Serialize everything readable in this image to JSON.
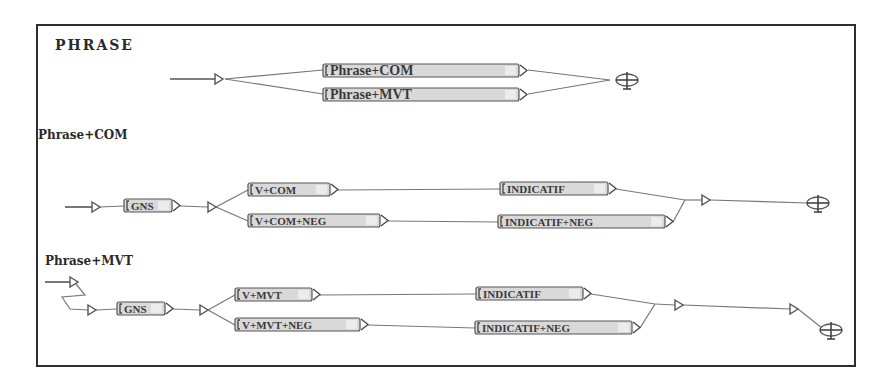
{
  "colors": {
    "frame": "#2e2e2e",
    "box_fill": "#d9d9d9",
    "box_border": "#555555",
    "edge": "#777777",
    "text": "#3a3a3a"
  },
  "frame": {
    "x": 37,
    "y": 25,
    "w": 818,
    "h": 341
  },
  "titles": [
    {
      "id": "title-phrase",
      "text": "PHRASE",
      "x": 55,
      "y": 50,
      "size": 14,
      "spacing": 2
    },
    {
      "id": "title-phrase-com",
      "text": "Phrase+COM",
      "x": 38,
      "y": 139,
      "size": 12,
      "spacing": 0
    },
    {
      "id": "title-phrase-mvt",
      "text": "Phrase+MVT",
      "x": 45,
      "y": 265,
      "size": 12,
      "spacing": 0
    }
  ],
  "graphs": [
    {
      "name": "PHRASE",
      "initial_line": [
        [
          170,
          79
        ],
        [
          215,
          79
        ]
      ],
      "initial_triangle": {
        "x": 215,
        "y": 79
      },
      "boxes": [
        {
          "label": "Phrase+COM",
          "x": 323,
          "y": 64,
          "w": 196,
          "h": 13,
          "size": 14
        },
        {
          "label": "Phrase+MVT",
          "x": 323,
          "y": 88,
          "w": 196,
          "h": 13,
          "size": 14
        }
      ],
      "edges": [
        [
          [
            225,
            79
          ],
          [
            323,
            70
          ]
        ],
        [
          [
            225,
            79
          ],
          [
            323,
            94
          ]
        ],
        [
          [
            528,
            70
          ],
          [
            610,
            80
          ]
        ],
        [
          [
            528,
            94
          ],
          [
            610,
            80
          ]
        ]
      ],
      "triangles": [],
      "final": {
        "x": 627,
        "y": 80
      }
    },
    {
      "name": "Phrase+COM",
      "initial_line": [
        [
          65,
          207
        ],
        [
          92,
          207
        ]
      ],
      "initial_triangle": {
        "x": 92,
        "y": 207
      },
      "boxes": [
        {
          "label": "GNS",
          "x": 124,
          "y": 199,
          "w": 48,
          "h": 13,
          "size": 11
        },
        {
          "label": "V+COM",
          "x": 248,
          "y": 183,
          "w": 82,
          "h": 13,
          "size": 11
        },
        {
          "label": "V+COM+NEG",
          "x": 248,
          "y": 214,
          "w": 132,
          "h": 13,
          "size": 11
        },
        {
          "label": "INDICATIF",
          "x": 500,
          "y": 182,
          "w": 108,
          "h": 13,
          "size": 11
        },
        {
          "label": "INDICATIF+NEG",
          "x": 498,
          "y": 215,
          "w": 167,
          "h": 13,
          "size": 11
        }
      ],
      "edges": [
        [
          [
            100,
            207
          ],
          [
            124,
            206
          ]
        ],
        [
          [
            180,
            206
          ],
          [
            208,
            207
          ]
        ],
        [
          [
            216,
            207
          ],
          [
            248,
            190
          ]
        ],
        [
          [
            216,
            207
          ],
          [
            248,
            221
          ]
        ],
        [
          [
            338,
            190
          ],
          [
            500,
            189
          ]
        ],
        [
          [
            388,
            221
          ],
          [
            498,
            222
          ]
        ],
        [
          [
            616,
            189
          ],
          [
            685,
            200
          ]
        ],
        [
          [
            673,
            222
          ],
          [
            685,
            200
          ]
        ],
        [
          [
            685,
            200
          ],
          [
            702,
            200
          ]
        ],
        [
          [
            710,
            200
          ],
          [
            808,
            203
          ]
        ]
      ],
      "triangles": [
        {
          "x": 208,
          "y": 207
        },
        {
          "x": 702,
          "y": 200
        }
      ],
      "final": {
        "x": 818,
        "y": 203
      }
    },
    {
      "name": "Phrase+MVT",
      "initial_line": [
        [
          45,
          282
        ],
        [
          70,
          282
        ]
      ],
      "initial_triangle": {
        "x": 70,
        "y": 282
      },
      "boxes": [
        {
          "label": "GNS",
          "x": 117,
          "y": 302,
          "w": 48,
          "h": 13,
          "size": 11
        },
        {
          "label": "V+MVT",
          "x": 235,
          "y": 288,
          "w": 77,
          "h": 13,
          "size": 11
        },
        {
          "label": "V+MVT+NEG",
          "x": 235,
          "y": 318,
          "w": 125,
          "h": 13,
          "size": 11
        },
        {
          "label": "INDICATIF",
          "x": 476,
          "y": 287,
          "w": 107,
          "h": 13,
          "size": 11
        },
        {
          "label": "INDICATIF+NEG",
          "x": 475,
          "y": 321,
          "w": 157,
          "h": 13,
          "size": 11
        }
      ],
      "edges": [
        [
          [
            76,
            284
          ],
          [
            85,
            295
          ],
          [
            62,
            297
          ],
          [
            70,
            309
          ],
          [
            88,
            310
          ]
        ],
        [
          [
            96,
            310
          ],
          [
            117,
            309
          ]
        ],
        [
          [
            173,
            309
          ],
          [
            200,
            310
          ]
        ],
        [
          [
            208,
            310
          ],
          [
            235,
            295
          ]
        ],
        [
          [
            208,
            310
          ],
          [
            235,
            325
          ]
        ],
        [
          [
            320,
            295
          ],
          [
            476,
            294
          ]
        ],
        [
          [
            368,
            325
          ],
          [
            475,
            328
          ]
        ],
        [
          [
            591,
            294
          ],
          [
            655,
            304
          ]
        ],
        [
          [
            640,
            328
          ],
          [
            655,
            304
          ]
        ],
        [
          [
            655,
            304
          ],
          [
            675,
            305
          ]
        ],
        [
          [
            683,
            305
          ],
          [
            790,
            309
          ]
        ],
        [
          [
            798,
            309
          ],
          [
            822,
            328
          ]
        ]
      ],
      "triangles": [
        {
          "x": 88,
          "y": 310
        },
        {
          "x": 200,
          "y": 310
        },
        {
          "x": 675,
          "y": 305
        },
        {
          "x": 790,
          "y": 309
        }
      ],
      "final": {
        "x": 831,
        "y": 330
      }
    }
  ]
}
